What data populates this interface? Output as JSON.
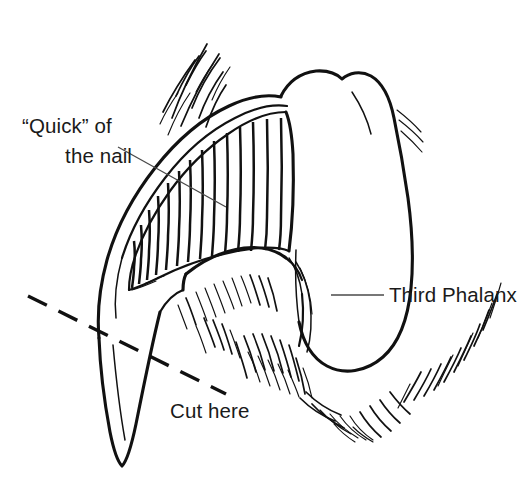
{
  "figure": {
    "background_color": "#ffffff",
    "ink_color": "#111111",
    "leader_color": "#4a4a4a",
    "width": 532,
    "height": 479
  },
  "labels": {
    "quick": {
      "line1": "“Quick” of",
      "line2": "the nail",
      "x1": 22,
      "y1": 133,
      "x2": 132,
      "y2": 163,
      "leader_from_x": 118,
      "leader_from_y": 147,
      "leader_to_x": 226,
      "leader_to_y": 207
    },
    "third_phalanx": {
      "text": "Third Phalanx",
      "x": 389,
      "y": 302,
      "leader_from_x": 331,
      "leader_from_y": 295,
      "leader_to_x": 384,
      "leader_to_y": 295
    },
    "cut_here": {
      "text": "Cut here",
      "x": 170,
      "y": 418,
      "dash_from_x": 28,
      "dash_from_y": 296,
      "dash_to_x": 226,
      "dash_to_y": 394
    }
  },
  "anatomy_parts": [
    {
      "name": "nail-outer-wall",
      "description": "outer keratin wall of the claw curving down to the tip"
    },
    {
      "name": "nail-tip",
      "description": "pointed distal end of the claw"
    },
    {
      "name": "quick",
      "description": "vascular core of the nail, drawn as a hatched wedge"
    },
    {
      "name": "third-phalanx",
      "description": "distal toe bone, large rounded form at right"
    },
    {
      "name": "digital-pad",
      "description": "paw pad below the bone"
    },
    {
      "name": "fur",
      "description": "hair strokes around the toe and above the nail"
    }
  ],
  "icons": {
    "quick_leader": "leader-line-icon",
    "phalanx_leader": "leader-line-icon",
    "cut_line": "dashed-cut-line-icon"
  }
}
